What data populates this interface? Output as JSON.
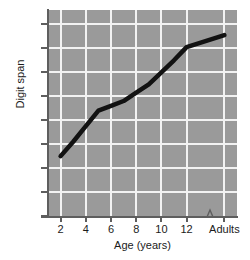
{
  "chart_data": {
    "type": "line",
    "title": "",
    "xlabel": "Age (years)",
    "ylabel": "Digit span",
    "x_tick_labels": [
      "2",
      "4",
      "6",
      "8",
      "10",
      "12",
      "Adults"
    ],
    "y_tick_labels": [
      "0",
      "1",
      "2",
      "3",
      "4",
      "5",
      "6",
      "7",
      "8"
    ],
    "ylim": [
      0,
      8.6
    ],
    "xlim": [
      1,
      16
    ],
    "grid": true,
    "legend": "none",
    "axis_break": {
      "present": true,
      "axis": "x",
      "between": [
        "12",
        "Adults"
      ],
      "symbol": "zigzag"
    },
    "categories": [
      2,
      3,
      4,
      5,
      6,
      7,
      8,
      9,
      10,
      11,
      12,
      15
    ],
    "series": [
      {
        "name": "Digit span",
        "color": "#121212",
        "values": [
          2.5,
          3.1,
          3.75,
          4.4,
          4.6,
          4.8,
          5.15,
          5.5,
          6.0,
          6.5,
          7.05,
          7.55
        ]
      }
    ],
    "annotations": []
  },
  "figure": {
    "plot_background_color": "#9a9a9a",
    "gridline_color": "#f2f2f2",
    "axis_color": "#5e5e5e",
    "page_background_color": "#ffffff"
  }
}
